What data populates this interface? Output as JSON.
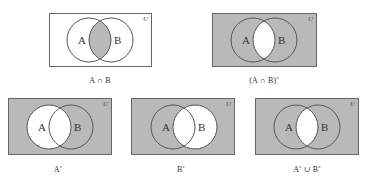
{
  "colors": {
    "shade": "#b9b9b9",
    "white": "#ffffff",
    "stroke": "#555555",
    "text": "#333333"
  },
  "universe_label": "U",
  "set_labels": {
    "a": "A",
    "b": "B"
  },
  "diagrams": [
    {
      "id": "a-intersect-b",
      "caption_main": "A ∩ B",
      "caption_sup": "",
      "shaded_region": "intersection only"
    },
    {
      "id": "complement-of-a-intersect-b",
      "caption_main": "(A ∩ B)",
      "caption_sup": "c",
      "shaded_region": "everything except intersection"
    },
    {
      "id": "a-complement",
      "caption_main": "A",
      "caption_sup": "c",
      "shaded_region": "everything outside A"
    },
    {
      "id": "b-complement",
      "caption_main": "B",
      "caption_sup": "c",
      "shaded_region": "everything outside B"
    },
    {
      "id": "a-complement-union-b-complement",
      "caption_main": "A",
      "caption_sup": "c",
      "caption_mid": " ∪ B",
      "caption_sup2": "c",
      "shaded_region": "everything except intersection"
    }
  ]
}
